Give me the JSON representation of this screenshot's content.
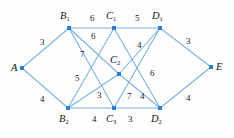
{
  "figure": {
    "name": "weighted-layered-graph",
    "edge_color": "#7fb2e0",
    "node_color": "#2f7fd0",
    "label_color": "#141414",
    "background": "#fdfdfd"
  },
  "nodes": [
    {
      "id": "A",
      "base": "A",
      "sub": "",
      "x": 22,
      "y": 68,
      "lx": 11,
      "ly": 63
    },
    {
      "id": "B1",
      "base": "B",
      "sub": "1",
      "x": 69,
      "y": 28,
      "lx": 60,
      "ly": 11
    },
    {
      "id": "B2",
      "base": "B",
      "sub": "2",
      "x": 68,
      "y": 108,
      "lx": 59,
      "ly": 114
    },
    {
      "id": "C1",
      "base": "C",
      "sub": "1",
      "x": 114,
      "y": 28,
      "lx": 106,
      "ly": 11
    },
    {
      "id": "C2",
      "base": "C",
      "sub": "2",
      "x": 119,
      "y": 74,
      "lx": 110,
      "ly": 55
    },
    {
      "id": "C3",
      "base": "C",
      "sub": "3",
      "x": 114,
      "y": 108,
      "lx": 106,
      "ly": 114
    },
    {
      "id": "D1",
      "base": "D",
      "sub": "1",
      "x": 160,
      "y": 28,
      "lx": 152,
      "ly": 11
    },
    {
      "id": "D2",
      "base": "D",
      "sub": "2",
      "x": 160,
      "y": 108,
      "lx": 151,
      "ly": 114
    },
    {
      "id": "E",
      "base": "E",
      "sub": "",
      "x": 211,
      "y": 67,
      "lx": 216,
      "ly": 62
    }
  ],
  "edges": [
    {
      "from": "A",
      "to": "B1"
    },
    {
      "from": "A",
      "to": "B2"
    },
    {
      "from": "B1",
      "to": "C1"
    },
    {
      "from": "B1",
      "to": "C2"
    },
    {
      "from": "B1",
      "to": "C3"
    },
    {
      "from": "B2",
      "to": "C1"
    },
    {
      "from": "B2",
      "to": "C2"
    },
    {
      "from": "B2",
      "to": "C3"
    },
    {
      "from": "C1",
      "to": "D1"
    },
    {
      "from": "C1",
      "to": "D2"
    },
    {
      "from": "C2",
      "to": "D1"
    },
    {
      "from": "C2",
      "to": "D2"
    },
    {
      "from": "C3",
      "to": "D1"
    },
    {
      "from": "C3",
      "to": "D2"
    },
    {
      "from": "D1",
      "to": "E"
    },
    {
      "from": "D2",
      "to": "E"
    }
  ],
  "edge_labels": [
    {
      "text": "3",
      "x": 40,
      "y": 38,
      "edge": "A-B1"
    },
    {
      "text": "4",
      "x": 40,
      "y": 95,
      "edge": "A-B2"
    },
    {
      "text": "6",
      "x": 90,
      "y": 14,
      "edge": "B1-C1"
    },
    {
      "text": "6",
      "x": 91,
      "y": 32,
      "edge": "B1-C2"
    },
    {
      "text": "7",
      "x": 80,
      "y": 50,
      "edge": "B1-C3"
    },
    {
      "text": "5",
      "x": 75,
      "y": 74,
      "edge": "B2-C1"
    },
    {
      "text": "3",
      "x": 97,
      "y": 91,
      "edge": "B2-C2"
    },
    {
      "text": "4",
      "x": 92,
      "y": 115,
      "edge": "B2-C3"
    },
    {
      "text": "5",
      "x": 135,
      "y": 14,
      "edge": "C1-D1"
    },
    {
      "text": "4",
      "x": 137,
      "y": 41,
      "edge": "C1-D2"
    },
    {
      "text": "6",
      "x": 150,
      "y": 69,
      "edge": "C2-D1"
    },
    {
      "text": "7",
      "x": 127,
      "y": 92,
      "edge": "C2-D2"
    },
    {
      "text": "4",
      "x": 140,
      "y": 92,
      "edge": "C3-D1"
    },
    {
      "text": "3",
      "x": 128,
      "y": 115,
      "edge": "C3-D2"
    },
    {
      "text": "3",
      "x": 186,
      "y": 37,
      "edge": "D1-E"
    },
    {
      "text": "4",
      "x": 186,
      "y": 94,
      "edge": "D2-E"
    }
  ]
}
